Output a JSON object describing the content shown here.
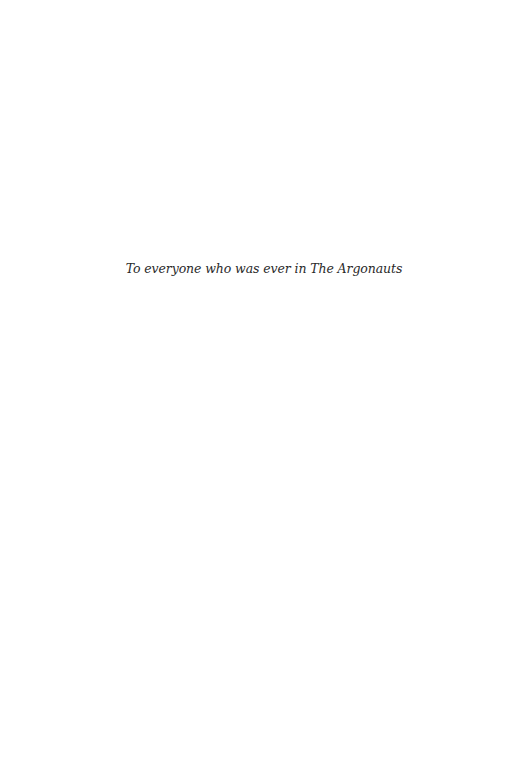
{
  "page": {
    "dedication": "To everyone who was ever in The Argonauts"
  }
}
